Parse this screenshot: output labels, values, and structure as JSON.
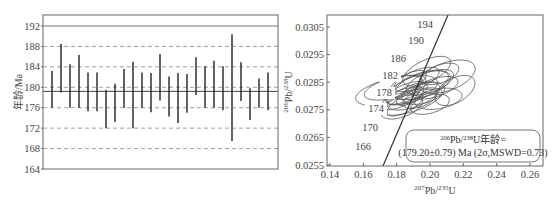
{
  "chart_data": [
    {
      "type": "errorbar",
      "title": "",
      "xlabel": "",
      "ylabel": "年龄/Ma",
      "ylim": [
        164,
        194
      ],
      "yticks": [
        164,
        168,
        172,
        176,
        180,
        184,
        188,
        192
      ],
      "grid": "dashed horizontal",
      "mean_line": 179.2,
      "reference_line": 192,
      "points": [
        {
          "low": 176.0,
          "high": 183.2
        },
        {
          "low": 179.0,
          "high": 188.5
        },
        {
          "low": 176.0,
          "high": 184.5
        },
        {
          "low": 176.0,
          "high": 186.3
        },
        {
          "low": 175.3,
          "high": 182.9
        },
        {
          "low": 175.3,
          "high": 182.9
        },
        {
          "low": 172.0,
          "high": 179.5
        },
        {
          "low": 173.2,
          "high": 180.7
        },
        {
          "low": 176.0,
          "high": 183.6
        },
        {
          "low": 172.0,
          "high": 185.0
        },
        {
          "low": 176.0,
          "high": 182.9
        },
        {
          "low": 175.1,
          "high": 182.8
        },
        {
          "low": 177.4,
          "high": 186.5
        },
        {
          "low": 174.3,
          "high": 182.1
        },
        {
          "low": 173.0,
          "high": 182.8
        },
        {
          "low": 175.0,
          "high": 182.6
        },
        {
          "low": 178.5,
          "high": 185.9
        },
        {
          "low": 176.0,
          "high": 184.1
        },
        {
          "low": 176.0,
          "high": 185.2
        },
        {
          "low": 175.5,
          "high": 184.1
        },
        {
          "low": 169.5,
          "high": 190.4
        },
        {
          "low": 177.3,
          "high": 184.9
        },
        {
          "low": 173.6,
          "high": 179.8
        },
        {
          "low": 176.0,
          "high": 181.7
        },
        {
          "low": 175.5,
          "high": 182.9
        }
      ]
    },
    {
      "type": "concordia",
      "xlabel": "207Pb/235U",
      "ylabel": "206Pb/238U",
      "xlim": [
        0.14,
        0.265
      ],
      "ylim": [
        0.0255,
        0.0308
      ],
      "xticks": [
        "0.14",
        "0.16",
        "0.18",
        "0.20",
        "0.22",
        "0.24",
        "0.26"
      ],
      "yticks": [
        "0.0255",
        "0.0265",
        "0.0275",
        "0.0285",
        "0.0295",
        "0.0305"
      ],
      "concordia_age_labels": [
        "166",
        "170",
        "174",
        "178",
        "182",
        "186",
        "190",
        "194"
      ],
      "annotation_line1": "206Pb/238U年龄=",
      "annotation_line2": "(179.20±0.79) Ma (2σ,MSWD=0.73)",
      "weighted_mean_age_ma": 179.2,
      "uncertainty_2sigma": 0.79,
      "mswd": 0.73
    }
  ],
  "left_chart": {
    "ylabel": "年龄/Ma",
    "yticks": [
      "164",
      "168",
      "172",
      "176",
      "180",
      "184",
      "188",
      "192"
    ]
  },
  "right_chart": {
    "yticks": [
      "0.0255",
      "0.0265",
      "0.0275",
      "0.0285",
      "0.0295",
      "0.0305"
    ],
    "xticks": [
      "0.14",
      "0.16",
      "0.18",
      "0.20",
      "0.22",
      "0.24",
      "0.26"
    ],
    "xlabel_sup1": "207",
    "xlabel_base1": "Pb/",
    "xlabel_sup2": "235",
    "xlabel_base2": "U",
    "ylabel_sup1": "206",
    "ylabel_base1": "Pb/",
    "ylabel_sup2": "238",
    "ylabel_base2": "U",
    "age_labels": [
      "194",
      "190",
      "186",
      "182",
      "178",
      "174",
      "170",
      "166"
    ],
    "annotation": {
      "sup1": "206",
      "base1": "Pb/",
      "sup2": "238",
      "base2": "U年龄=",
      "line2": "(179.20±0.79) Ma (2σ,MSWD=0.73)"
    }
  }
}
